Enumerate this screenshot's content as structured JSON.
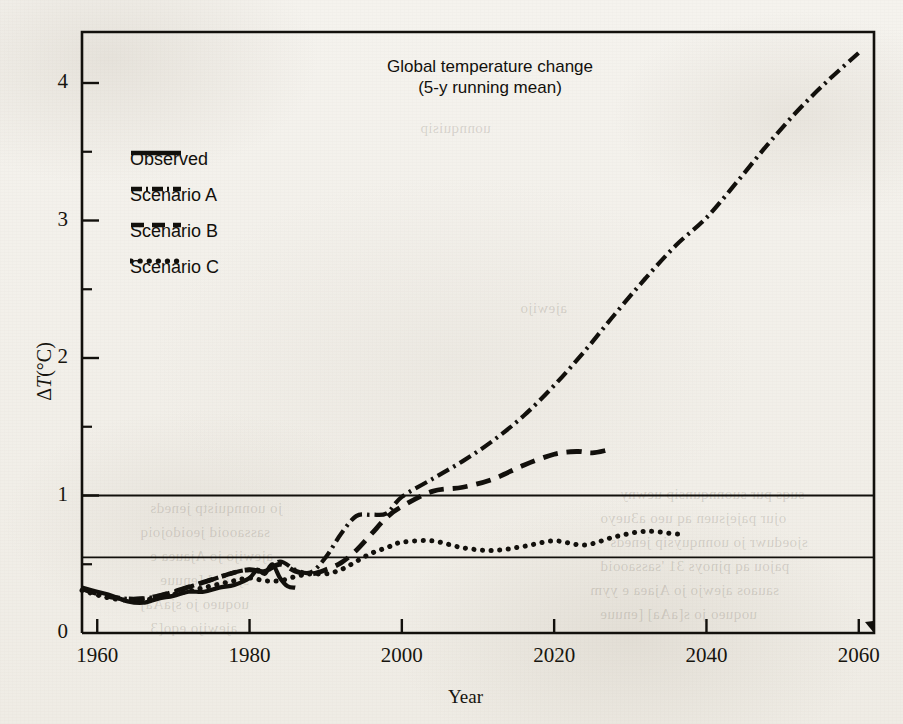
{
  "figure": {
    "title_line1": "Global temperature change",
    "title_line2": "(5-y running mean)",
    "background_color": "#f3f1ec",
    "ink_color": "#12100c"
  },
  "axes": {
    "x": {
      "label": "Year",
      "ticks": [
        "1960",
        "1980",
        "2000",
        "2020",
        "2040",
        "2060"
      ],
      "tick_values": [
        1960,
        1980,
        2000,
        2020,
        2040,
        2060
      ],
      "range": [
        1958,
        2062
      ],
      "minor_tick_step": 20
    },
    "y": {
      "label_delta": "Δ",
      "label_T": "T",
      "label_unit": "(°C)",
      "label_full": "ΔT(°C)",
      "ticks": [
        "0",
        "1",
        "2",
        "3",
        "4"
      ],
      "tick_values": [
        0,
        1,
        2,
        3,
        4
      ],
      "minor_tick_values": [
        0.5,
        1.5,
        2.5,
        3.5
      ],
      "range": [
        0,
        4.37
      ]
    },
    "gridlines": [
      1.0,
      0.55
    ]
  },
  "legend": {
    "position": "upper-left",
    "items": [
      {
        "label": "Observed",
        "style": "solid",
        "key": "observed"
      },
      {
        "label": "Scenario A",
        "style": "dash-dot",
        "key": "scenario_a"
      },
      {
        "label": "Scenario B",
        "style": "dashed",
        "key": "scenario_b"
      },
      {
        "label": "Scenario C",
        "style": "dotted",
        "key": "scenario_c"
      }
    ]
  },
  "chart_data": {
    "type": "line",
    "title": "Global temperature change (5-y running mean)",
    "xlabel": "Year",
    "ylabel": "ΔT(°C)",
    "xlim": [
      1958,
      2062
    ],
    "ylim": [
      0,
      4.37
    ],
    "grid": "horizontal gridlines at ΔT = 0.55 and 1.0",
    "legend_position": "upper-left",
    "series": [
      {
        "name": "Observed",
        "style": "solid",
        "x": [
          1958,
          1960,
          1962,
          1964,
          1966,
          1968,
          1970,
          1972,
          1974,
          1976,
          1978,
          1980,
          1981,
          1982,
          1983,
          1984,
          1985,
          1986
        ],
        "y": [
          0.33,
          0.3,
          0.27,
          0.23,
          0.22,
          0.25,
          0.27,
          0.3,
          0.3,
          0.33,
          0.35,
          0.4,
          0.46,
          0.43,
          0.5,
          0.4,
          0.34,
          0.33
        ]
      },
      {
        "name": "Scenario A",
        "style": "dash-dot",
        "x": [
          1958,
          1962,
          1966,
          1970,
          1974,
          1978,
          1980,
          1982,
          1984,
          1986,
          1988,
          1990,
          1992,
          1994,
          1996,
          1998,
          2000,
          2004,
          2008,
          2012,
          2016,
          2020,
          2024,
          2028,
          2032,
          2036,
          2040,
          2044,
          2048,
          2052,
          2056,
          2060
        ],
        "y": [
          0.32,
          0.26,
          0.25,
          0.3,
          0.37,
          0.44,
          0.46,
          0.45,
          0.52,
          0.46,
          0.44,
          0.55,
          0.72,
          0.85,
          0.86,
          0.87,
          0.99,
          1.12,
          1.25,
          1.4,
          1.58,
          1.8,
          2.05,
          2.32,
          2.58,
          2.82,
          3.02,
          3.28,
          3.55,
          3.8,
          4.02,
          4.22
        ]
      },
      {
        "name": "Scenario B",
        "style": "dashed",
        "x": [
          1958,
          1962,
          1966,
          1970,
          1974,
          1978,
          1980,
          1982,
          1984,
          1986,
          1988,
          1990,
          1992,
          1994,
          1996,
          1998,
          2000,
          2004,
          2008,
          2012,
          2016,
          2020,
          2023,
          2025,
          2027
        ],
        "y": [
          0.32,
          0.26,
          0.25,
          0.3,
          0.37,
          0.44,
          0.46,
          0.45,
          0.5,
          0.45,
          0.43,
          0.46,
          0.51,
          0.6,
          0.72,
          0.84,
          0.92,
          1.03,
          1.06,
          1.12,
          1.22,
          1.3,
          1.32,
          1.31,
          1.33
        ]
      },
      {
        "name": "Scenario C",
        "style": "dotted",
        "x": [
          1958,
          1962,
          1966,
          1970,
          1974,
          1978,
          1980,
          1982,
          1984,
          1986,
          1988,
          1990,
          1992,
          1994,
          1996,
          1998,
          2000,
          2004,
          2008,
          2012,
          2016,
          2020,
          2024,
          2028,
          2032,
          2036,
          2037
        ],
        "y": [
          0.31,
          0.25,
          0.24,
          0.28,
          0.33,
          0.38,
          0.4,
          0.38,
          0.38,
          0.41,
          0.43,
          0.43,
          0.46,
          0.52,
          0.58,
          0.62,
          0.66,
          0.67,
          0.62,
          0.6,
          0.63,
          0.67,
          0.64,
          0.7,
          0.74,
          0.72,
          0.72
        ]
      }
    ]
  },
  "bleed_through": [
    {
      "text": "suqs pur suonnqunsip uewny",
      "x": 620,
      "y": 486
    },
    {
      "text": "ojur pajejsuen aq ueo a3ueyo",
      "x": 600,
      "y": 510
    },
    {
      "text": "sjoeduwr jo uonnquysip jeneds",
      "x": 610,
      "y": 534
    },
    {
      "text": "pajou aq pjnoys 31 'sassaooid",
      "x": 600,
      "y": 558
    },
    {
      "text": "sauaos ajewjo jo Ajaea e yym",
      "x": 590,
      "y": 582
    },
    {
      "text": "uoqueo jo s[aAa] [enuue",
      "x": 600,
      "y": 606
    },
    {
      "text": "jo uonnquistp jeneds",
      "x": 150,
      "y": 500
    },
    {
      "text": "sassaooid jeoidojoiq",
      "x": 140,
      "y": 524
    },
    {
      "text": "ajewijo jo Ajauea e",
      "x": 150,
      "y": 548
    },
    {
      "text": "sjaAa] [enuue",
      "x": 160,
      "y": 572
    },
    {
      "text": "uoqueo jo sjaAa]",
      "x": 140,
      "y": 596
    },
    {
      "text": "ajewijo eqo[3",
      "x": 150,
      "y": 620
    },
    {
      "text": "uonnquisip",
      "x": 420,
      "y": 120
    },
    {
      "text": "ajewijo",
      "x": 520,
      "y": 300
    }
  ]
}
